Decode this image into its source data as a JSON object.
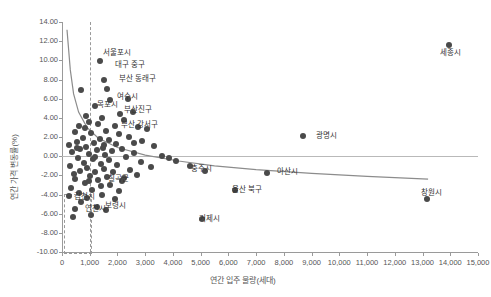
{
  "chart_data": {
    "type": "scatter",
    "title": "",
    "xlabel": "연간 입주 물량(세대)",
    "ylabel": "연간 가격 변동률(%)",
    "xlim": [
      0,
      15000
    ],
    "ylim": [
      -10.0,
      14.0
    ],
    "xticks": [
      "0",
      "1,000",
      "2,000",
      "3,000",
      "4,000",
      "5,000",
      "6,000",
      "7,000",
      "8,000",
      "9,000",
      "10,000",
      "11,000",
      "12,000",
      "13,000",
      "14,000",
      "15,000"
    ],
    "yticks": [
      "14.00",
      "12.00",
      "10.00",
      "8.00",
      "6.00",
      "4.00",
      "2.00",
      "0.00",
      "-2.00",
      "-4.00",
      "-6.00",
      "-8.00",
      "-10.00"
    ],
    "grid": false,
    "legend": "none",
    "trendline": {
      "description": "decaying power-law fit",
      "points": [
        [
          180,
          13.2
        ],
        [
          300,
          9.0
        ],
        [
          420,
          6.5
        ],
        [
          600,
          4.6
        ],
        [
          900,
          3.0
        ],
        [
          1300,
          1.9
        ],
        [
          2000,
          0.9
        ],
        [
          3000,
          0.1
        ],
        [
          4200,
          -0.5
        ],
        [
          5500,
          -1.0
        ],
        [
          7000,
          -1.4
        ],
        [
          9000,
          -1.8
        ],
        [
          11000,
          -2.1
        ],
        [
          13200,
          -2.4
        ]
      ]
    },
    "annotations": [
      {
        "label": "서울포시",
        "x": 1330,
        "y": 11.0
      },
      {
        "label": "대구 중구",
        "x": 1750,
        "y": 9.7
      },
      {
        "label": "부산 동래구",
        "x": 1900,
        "y": 8.3
      },
      {
        "label": "여수시",
        "x": 1830,
        "y": 6.4
      },
      {
        "label": "목포시",
        "x": 1120,
        "y": 5.6
      },
      {
        "label": "부산진구",
        "x": 2100,
        "y": 5.0
      },
      {
        "label": "부산 강서구",
        "x": 1980,
        "y": 3.5
      },
      {
        "label": "세종시",
        "x": 13500,
        "y": 11.0
      },
      {
        "label": "광명시",
        "x": 9000,
        "y": 2.3
      },
      {
        "label": "충주시",
        "x": 4500,
        "y": -1.1
      },
      {
        "label": "아산시",
        "x": 7600,
        "y": -1.4
      },
      {
        "label": "창원시",
        "x": 12800,
        "y": -3.6
      },
      {
        "label": "칠곡군",
        "x": 1500,
        "y": -2.2
      },
      {
        "label": "김천시",
        "x": 300,
        "y": -4.0
      },
      {
        "label": "연천시",
        "x": 700,
        "y": -5.3
      },
      {
        "label": "보령시",
        "x": 1400,
        "y": -5.0
      },
      {
        "label": "울산 북구",
        "x": 6000,
        "y": -3.3
      },
      {
        "label": "거제시",
        "x": 4800,
        "y": -6.3
      }
    ],
    "points": [
      [
        13950,
        11.6
      ],
      [
        1380,
        9.9
      ],
      [
        1500,
        8.0
      ],
      [
        1620,
        7.0
      ],
      [
        700,
        6.9
      ],
      [
        2380,
        6.0
      ],
      [
        1730,
        5.9
      ],
      [
        1180,
        5.2
      ],
      [
        2560,
        4.6
      ],
      [
        2100,
        4.4
      ],
      [
        850,
        4.2
      ],
      [
        1450,
        4.0
      ],
      [
        2250,
        3.8
      ],
      [
        980,
        3.6
      ],
      [
        1300,
        3.4
      ],
      [
        1900,
        3.2
      ],
      [
        620,
        3.1
      ],
      [
        2750,
        3.0
      ],
      [
        3050,
        2.8
      ],
      [
        1600,
        2.6
      ],
      [
        460,
        2.5
      ],
      [
        1050,
        2.4
      ],
      [
        2050,
        2.3
      ],
      [
        8680,
        2.1
      ],
      [
        2400,
        2.0
      ],
      [
        760,
        1.9
      ],
      [
        1360,
        1.8
      ],
      [
        1700,
        1.7
      ],
      [
        2900,
        1.6
      ],
      [
        540,
        1.5
      ],
      [
        1150,
        1.4
      ],
      [
        1950,
        1.3
      ],
      [
        260,
        1.2
      ],
      [
        3300,
        1.1
      ],
      [
        880,
        1.0
      ],
      [
        1480,
        0.9
      ],
      [
        2180,
        0.8
      ],
      [
        660,
        0.7
      ],
      [
        1250,
        0.6
      ],
      [
        1820,
        0.5
      ],
      [
        360,
        0.4
      ],
      [
        2600,
        0.35
      ],
      [
        960,
        0.2
      ],
      [
        1560,
        0.1
      ],
      [
        3600,
        0.05
      ],
      [
        2300,
        -0.05
      ],
      [
        560,
        -0.2
      ],
      [
        1120,
        -0.3
      ],
      [
        1680,
        -0.4
      ],
      [
        4100,
        -0.5
      ],
      [
        2850,
        -0.6
      ],
      [
        780,
        -0.7
      ],
      [
        1400,
        -0.8
      ],
      [
        2000,
        -0.9
      ],
      [
        300,
        -1.0
      ],
      [
        3200,
        -1.1
      ],
      [
        900,
        -1.2
      ],
      [
        1520,
        -1.3
      ],
      [
        2450,
        -1.4
      ],
      [
        640,
        -1.5
      ],
      [
        1200,
        -1.6
      ],
      [
        1850,
        -1.7
      ],
      [
        5150,
        -1.5
      ],
      [
        420,
        -1.9
      ],
      [
        2700,
        -2.0
      ],
      [
        1000,
        -2.1
      ],
      [
        1620,
        -2.2
      ],
      [
        7400,
        -1.8
      ],
      [
        480,
        -2.4
      ],
      [
        1300,
        -2.5
      ],
      [
        2150,
        -2.6
      ],
      [
        820,
        -2.8
      ],
      [
        1740,
        -3.0
      ],
      [
        6250,
        -3.5
      ],
      [
        340,
        -3.3
      ],
      [
        1080,
        -3.5
      ],
      [
        2050,
        -3.6
      ],
      [
        600,
        -3.8
      ],
      [
        1450,
        -4.1
      ],
      [
        240,
        -4.2
      ],
      [
        900,
        -4.4
      ],
      [
        1900,
        -4.5
      ],
      [
        700,
        -4.8
      ],
      [
        1250,
        -5.3
      ],
      [
        460,
        -5.5
      ],
      [
        1600,
        -5.6
      ],
      [
        5050,
        -6.6
      ],
      [
        1050,
        -6.1
      ],
      [
        13150,
        -4.5
      ],
      [
        380,
        -6.3
      ],
      [
        1400,
        -3.1
      ],
      [
        2250,
        -2.3
      ],
      [
        3850,
        -0.2
      ],
      [
        4600,
        -1.0
      ],
      [
        820,
        2.9
      ],
      [
        1180,
        -0.1
      ],
      [
        1520,
        1.2
      ],
      [
        2600,
        1.4
      ],
      [
        540,
        0.9
      ],
      [
        960,
        -2.6
      ]
    ]
  }
}
